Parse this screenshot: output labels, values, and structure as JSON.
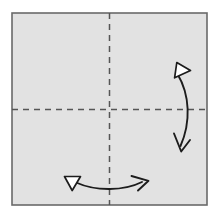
{
  "figure": {
    "type": "origami-instruction",
    "canvas": {
      "width": 222,
      "height": 216,
      "background": "#ffffff"
    }
  },
  "paper": {
    "name": "square-sheet",
    "shape": "square",
    "fill_color": "#e2e2e2",
    "stroke_color": "#6a6a6a",
    "stroke_width": 1.6,
    "x": 12,
    "y": 13,
    "width": 195,
    "height": 192
  },
  "crease_lines": [
    {
      "name": "vertical-crease",
      "orientation": "vertical",
      "style": "dashed",
      "color": "#555555",
      "stroke_width": 1.5,
      "dash": "6 5",
      "x1": 109.5,
      "y1": 13,
      "x2": 109.5,
      "y2": 205
    },
    {
      "name": "horizontal-crease",
      "orientation": "horizontal",
      "style": "dashed",
      "color": "#555555",
      "stroke_width": 1.5,
      "dash": "6 5",
      "x1": 12,
      "y1": 109.5,
      "x2": 207,
      "y2": 109.5
    }
  ],
  "arrows": [
    {
      "name": "right-fold-arrow",
      "orientation": "vertical",
      "description": "curved double-headed fold-and-unfold arrow on right side, bowing right",
      "color": "#1c1c1c",
      "stroke_width": 1.9,
      "path": "M 177.5 74 C 190 95 191 122 180.5 146",
      "head_start": {
        "type": "hollow-triangle",
        "fill": "#ffffff",
        "points": "176.8,62.5 190.5,70.5 174.6,77.8",
        "direction": "up-right"
      },
      "head_end": {
        "type": "open-v",
        "points": "174.0,133.5 181.2,151.5 190.0,140.0",
        "direction": "down"
      }
    },
    {
      "name": "bottom-fold-arrow",
      "orientation": "horizontal",
      "description": "curved double-headed fold-and-unfold arrow along bottom, bowing down",
      "color": "#1c1c1c",
      "stroke_width": 1.9,
      "path": "M 76 182.5 C 96 191.5 124 191 142 182",
      "head_start": {
        "type": "hollow-triangle",
        "fill": "#ffffff",
        "points": "64.5,176.5 80.5,176.5 72.2,190.5",
        "direction": "down-left"
      },
      "head_end": {
        "type": "open-v",
        "points": "131.5,176.0 148.5,180.8 138.0,190.5",
        "direction": "right"
      }
    }
  ]
}
